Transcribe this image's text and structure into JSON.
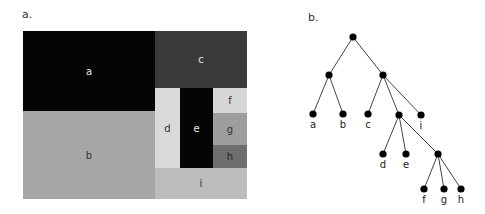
{
  "panels": {
    "a": {
      "label": "a."
    },
    "b": {
      "label": "b."
    }
  },
  "treemap": {
    "cells": [
      {
        "id": "a",
        "label": "a",
        "x": 0,
        "y": 0,
        "w": 132,
        "h": 80,
        "bg": "#050505",
        "fg": "#e8e8e8"
      },
      {
        "id": "b",
        "label": "b",
        "x": 0,
        "y": 80,
        "w": 132,
        "h": 88,
        "bg": "#a6a6a6",
        "fg": "#333333"
      },
      {
        "id": "c",
        "label": "c",
        "x": 132,
        "y": 0,
        "w": 92,
        "h": 57,
        "bg": "#3a3a3a",
        "fg": "#e8e8e8"
      },
      {
        "id": "d",
        "label": "d",
        "x": 132,
        "y": 57,
        "w": 25,
        "h": 80,
        "bg": "#d9d9d9",
        "fg": "#333333"
      },
      {
        "id": "e",
        "label": "e",
        "x": 157,
        "y": 57,
        "w": 33,
        "h": 80,
        "bg": "#050505",
        "fg": "#e8e8e8"
      },
      {
        "id": "f",
        "label": "f",
        "x": 190,
        "y": 57,
        "w": 34,
        "h": 25,
        "bg": "#d6d6d6",
        "fg": "#333333"
      },
      {
        "id": "g",
        "label": "g",
        "x": 190,
        "y": 82,
        "w": 34,
        "h": 32,
        "bg": "#9e9e9e",
        "fg": "#333333"
      },
      {
        "id": "h",
        "label": "h",
        "x": 190,
        "y": 114,
        "w": 34,
        "h": 23,
        "bg": "#6e6e6e",
        "fg": "#222222"
      },
      {
        "id": "i",
        "label": "i",
        "x": 132,
        "y": 137,
        "w": 92,
        "h": 31,
        "bg": "#bdbdbd",
        "fg": "#333333"
      }
    ]
  },
  "tree": {
    "nodes": [
      {
        "id": "root",
        "x": 63,
        "y": 37,
        "label": ""
      },
      {
        "id": "n1",
        "x": 39,
        "y": 75,
        "label": ""
      },
      {
        "id": "n2",
        "x": 93,
        "y": 75,
        "label": ""
      },
      {
        "id": "a",
        "x": 23,
        "y": 114,
        "label": "a"
      },
      {
        "id": "b",
        "x": 53,
        "y": 114,
        "label": "b"
      },
      {
        "id": "c",
        "x": 78,
        "y": 114,
        "label": "c"
      },
      {
        "id": "n3",
        "x": 109,
        "y": 115,
        "label": ""
      },
      {
        "id": "i",
        "x": 131,
        "y": 115,
        "label": "i"
      },
      {
        "id": "d",
        "x": 93,
        "y": 154,
        "label": "d"
      },
      {
        "id": "e",
        "x": 116,
        "y": 154,
        "label": "e"
      },
      {
        "id": "n4",
        "x": 148,
        "y": 154,
        "label": ""
      },
      {
        "id": "f",
        "x": 134,
        "y": 189,
        "label": "f"
      },
      {
        "id": "g",
        "x": 154,
        "y": 189,
        "label": "g"
      },
      {
        "id": "h",
        "x": 171,
        "y": 189,
        "label": "h"
      }
    ],
    "edges": [
      [
        "root",
        "n1"
      ],
      [
        "root",
        "n2"
      ],
      [
        "n1",
        "a"
      ],
      [
        "n1",
        "b"
      ],
      [
        "n2",
        "c"
      ],
      [
        "n2",
        "n3"
      ],
      [
        "n2",
        "i"
      ],
      [
        "n3",
        "d"
      ],
      [
        "n3",
        "e"
      ],
      [
        "n3",
        "n4"
      ],
      [
        "n4",
        "f"
      ],
      [
        "n4",
        "g"
      ],
      [
        "n4",
        "h"
      ]
    ]
  }
}
